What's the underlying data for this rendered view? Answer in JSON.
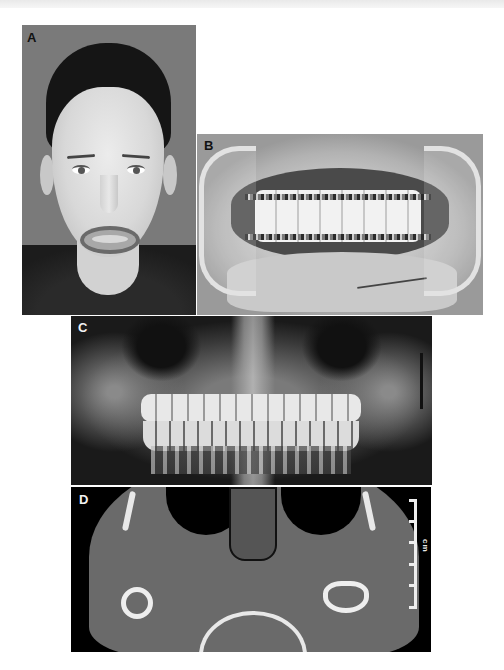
{
  "figure": {
    "panels": [
      {
        "label": "A",
        "description": "Frontal facial photograph of a young patient showing lip laceration and sutures on lower lip and chin"
      },
      {
        "label": "B",
        "description": "Intraoral photograph with cheek retractors showing arch bars and wire fixation on upper and lower dentition; sutured lower lip"
      },
      {
        "label": "C",
        "description": "Panoramic radiograph showing dentition with intermaxillary fixation"
      },
      {
        "label": "D",
        "description": "Axial CT scan at level of mandibular condyles with scale bar"
      }
    ],
    "panelD_scale": {
      "text": "cm",
      "ticks": 6
    }
  }
}
